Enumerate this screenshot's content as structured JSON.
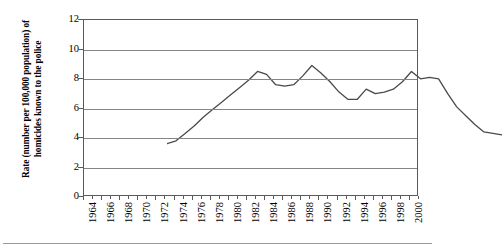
{
  "chart_data": {
    "type": "line",
    "title": "",
    "xlabel": "",
    "ylabel": "Rate (number per 100,000 population) of homicides known to the police",
    "ylim": [
      0,
      12
    ],
    "xlim": [
      1964,
      2001
    ],
    "ytick_labels": [
      "0",
      "2",
      "4",
      "6",
      "8",
      "10",
      "12"
    ],
    "ytick_values": [
      0,
      2,
      4,
      6,
      8,
      10,
      12
    ],
    "xtick_labels": [
      "1964",
      "1966",
      "1968",
      "1970",
      "1972",
      "1974",
      "1976",
      "1978",
      "1980",
      "1982",
      "1984",
      "1986",
      "1988",
      "1990",
      "1992",
      "1994",
      "1996",
      "1998",
      "2000"
    ],
    "xtick_values": [
      1964,
      1966,
      1968,
      1970,
      1972,
      1974,
      1976,
      1978,
      1980,
      1982,
      1984,
      1986,
      1988,
      1990,
      1992,
      1994,
      1996,
      1998,
      2000
    ],
    "grid": true,
    "legend": false,
    "line_color": "#4a4a4a",
    "series": [
      {
        "name": "Homicide rate",
        "x": [
          1964,
          1965,
          1966,
          1967,
          1968,
          1969,
          1970,
          1971,
          1972,
          1973,
          1974,
          1975,
          1976,
          1977,
          1978,
          1979,
          1980,
          1981,
          1982,
          1983,
          1984,
          1985,
          1986,
          1987,
          1988,
          1989,
          1990,
          1991,
          1992,
          1993,
          1994,
          1995,
          1996,
          1997,
          1998,
          1999,
          2000,
          2001
        ],
        "values": [
          4.9,
          5.1,
          5.6,
          6.1,
          6.7,
          7.2,
          7.7,
          8.2,
          8.7,
          9.2,
          9.8,
          9.6,
          8.9,
          8.8,
          8.9,
          9.5,
          10.2,
          9.7,
          9.1,
          8.4,
          7.9,
          7.9,
          8.6,
          8.3,
          8.4,
          8.6,
          9.1,
          9.8,
          9.3,
          9.4,
          9.3,
          8.3,
          7.4,
          6.8,
          6.2,
          5.7,
          5.6,
          5.5
        ]
      }
    ]
  },
  "axis": {
    "y_title": "Rate (number per 100,000 population) of homicides known to the police"
  }
}
